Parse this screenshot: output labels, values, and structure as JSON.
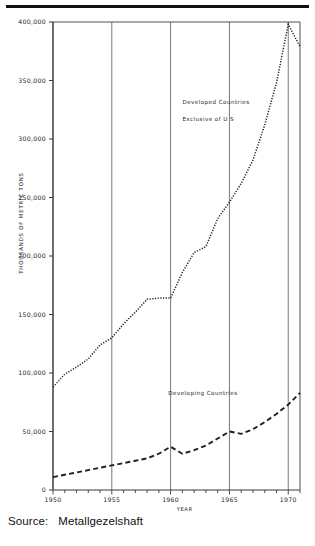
{
  "figure": {
    "source_label": "Source:",
    "source_value": "Metallgezelshaft"
  },
  "chart_data": {
    "type": "line",
    "title": "",
    "subtitle": "",
    "xlabel": "YEAR",
    "ylabel": "THOUSANDS OF METRIC TONS",
    "xlim": [
      1950,
      1971
    ],
    "ylim": [
      0,
      400000
    ],
    "grid": "vertical gridlines at each labeled x tick",
    "legend_position": "inline annotations next to curves",
    "x_ticks": [
      1950,
      1955,
      1960,
      1965,
      1970
    ],
    "x_tick_labels": [
      "1950",
      "1955",
      "1960",
      "1965",
      "1970"
    ],
    "x_minor_tick_step": 1,
    "y_ticks": [
      0,
      50000,
      100000,
      150000,
      200000,
      250000,
      300000,
      350000,
      400000
    ],
    "y_tick_labels": [
      "0",
      "50,000",
      "100,000",
      "150,000",
      "200,000",
      "250,000",
      "300,000",
      "350,000",
      "400,000"
    ],
    "series": [
      {
        "name": "Developed Countries Exclusive of U S",
        "annotation_lines": [
          "Developed Countries",
          "Exclusive of U S"
        ],
        "style": "dotted",
        "color": "#1f1f24",
        "x": [
          1950,
          1951,
          1952,
          1953,
          1954,
          1955,
          1956,
          1957,
          1958,
          1959,
          1960,
          1961,
          1962,
          1963,
          1964,
          1965,
          1966,
          1967,
          1968,
          1969,
          1970,
          1971
        ],
        "values": [
          88000,
          99000,
          105000,
          112000,
          124000,
          130000,
          142000,
          152000,
          163000,
          164000,
          164000,
          186000,
          203000,
          208000,
          232000,
          246000,
          262000,
          282000,
          312000,
          348000,
          398000,
          379000
        ]
      },
      {
        "name": "Developing Countries",
        "annotation_lines": [
          "Developing Countries"
        ],
        "style": "dashed",
        "color": "#1f1f24",
        "x": [
          1950,
          1951,
          1952,
          1953,
          1954,
          1955,
          1956,
          1957,
          1958,
          1959,
          1960,
          1961,
          1962,
          1963,
          1964,
          1965,
          1966,
          1967,
          1968,
          1969,
          1970,
          1971
        ],
        "values": [
          11000,
          13000,
          15000,
          17000,
          19000,
          21000,
          23000,
          25000,
          27000,
          31000,
          37000,
          31000,
          34000,
          38000,
          44000,
          50000,
          48000,
          52000,
          58000,
          65000,
          73000,
          83000
        ]
      }
    ],
    "annotations": [
      {
        "text": "Developed Countries",
        "x": 1961.0,
        "y": 332000
      },
      {
        "text": "Exclusive of U S",
        "x": 1961.0,
        "y": 317000
      },
      {
        "text": "Developing Countries",
        "x": 1959.8,
        "y": 83000
      }
    ]
  }
}
